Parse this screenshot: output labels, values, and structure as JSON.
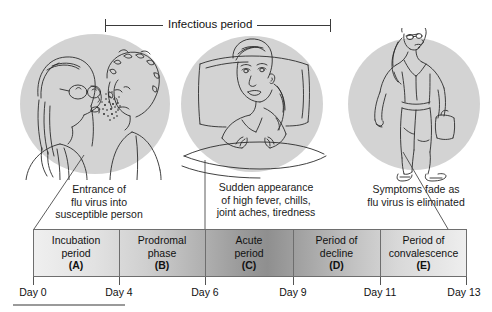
{
  "header": {
    "bracket_label": "Infectious period",
    "bracket_start_day": 4,
    "bracket_end_day": 9
  },
  "illustrations": [
    {
      "name": "transmission-scene",
      "alt": "Person coughing flu virus droplets toward a susceptible person",
      "caption": "Entrance of\nflu virus into\nsusceptible person",
      "caption_lines": [
        "Entrance of",
        "flu virus into",
        "susceptible person"
      ]
    },
    {
      "name": "sick-in-bed-scene",
      "alt": "Girl lying sick in bed against a pillow",
      "caption": "Sudden appearance\nof high fever, chills,\njoint aches, tiredness",
      "caption_lines": [
        "Sudden appearance",
        "of high fever, chills,",
        "joint aches, tiredness"
      ]
    },
    {
      "name": "recovered-walking-scene",
      "alt": "Recovered woman walking while carrying a bag",
      "caption": "Symptoms fade as\nflu virus is eliminated",
      "caption_lines": [
        "Symptoms fade as",
        "flu virus is eliminated"
      ]
    }
  ],
  "timeline": {
    "segments": [
      {
        "label_lines": [
          "Incubation",
          "period"
        ],
        "letter": "(A)",
        "start_day": 0,
        "end_day": 4
      },
      {
        "label_lines": [
          "Prodromal",
          "phase"
        ],
        "letter": "(B)",
        "start_day": 4,
        "end_day": 6
      },
      {
        "label_lines": [
          "Acute",
          "period"
        ],
        "letter": "(C)",
        "start_day": 6,
        "end_day": 9
      },
      {
        "label_lines": [
          "Period of",
          "decline"
        ],
        "letter": "(D)",
        "start_day": 9,
        "end_day": 11
      },
      {
        "label_lines": [
          "Period of",
          "convalescence"
        ],
        "letter": "(E)",
        "start_day": 11,
        "end_day": 13
      }
    ],
    "day_ticks": [
      "Day 0",
      "Day 4",
      "Day 6",
      "Day 9",
      "Day 11",
      "Day 13"
    ]
  },
  "colors": {
    "circle_fill": "#d3d3d3",
    "band_light": "#efefef",
    "band_dark": "#8f8f8f",
    "stroke": "#3a3a3a",
    "text": "#111111"
  }
}
